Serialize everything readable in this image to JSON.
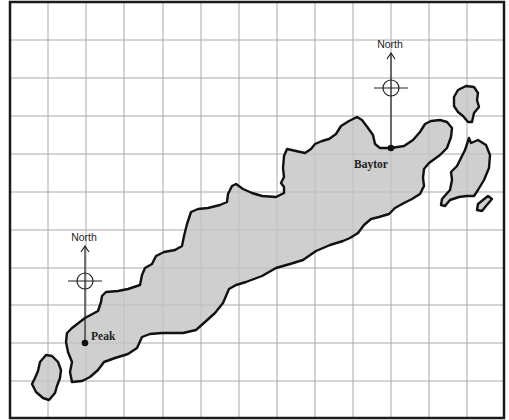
{
  "map": {
    "background": "#ffffff",
    "land_fill": "#cfcfcf",
    "coast_color": "#111111",
    "grid_color": "#a8a8a8",
    "grid": {
      "vertical_x": [
        48,
        86,
        124,
        163,
        201,
        239,
        277,
        315,
        353,
        391,
        429,
        467
      ],
      "horizontal_y": [
        40,
        78,
        116,
        154,
        192,
        230,
        268,
        305,
        343,
        381
      ]
    }
  },
  "towns": [
    {
      "name": "Peak",
      "x": 85,
      "y": 343
    },
    {
      "name": "Baytor",
      "x": 391,
      "y": 148
    }
  ],
  "compasses": [
    {
      "label": "North",
      "town": "Peak"
    },
    {
      "label": "North",
      "town": "Baytor"
    }
  ]
}
